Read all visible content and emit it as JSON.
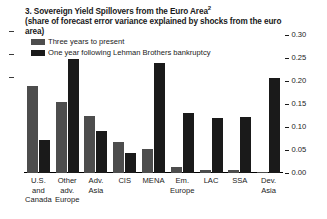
{
  "panel": {
    "number": "3.",
    "title_line1": "Sovereign Yield Spillovers from the Euro Area",
    "title_superscript": "2",
    "title_line2": "(share of forecast error variance explained by shocks from the euro area)"
  },
  "legend": {
    "position": "top-left",
    "items": [
      {
        "label": "Three years to present",
        "color": "#4d4d4d"
      },
      {
        "label": "One year following Lehman Brothers bankruptcy",
        "color": "#1a1a1a"
      }
    ]
  },
  "axis": {
    "side": "right",
    "ticks": [
      "0.00",
      "0.05",
      "0.10",
      "0.15",
      "0.20",
      "0.25",
      "0.30"
    ],
    "min": 0.0,
    "max": 0.3
  },
  "chart_data": {
    "type": "bar",
    "title": "3. Sovereign Yield Spillovers from the Euro Area",
    "subtitle": "(share of forecast error variance explained by shocks from the euro area)",
    "xlabel": "",
    "ylabel": "",
    "ylim": [
      0.0,
      0.3
    ],
    "yticks": [
      0.0,
      0.05,
      0.1,
      0.15,
      0.2,
      0.25,
      0.3
    ],
    "y_axis_position": "right",
    "grid": false,
    "legend_position": "top-left",
    "categories": [
      "U.S. and Canada",
      "Other adv. Europe",
      "Adv. Asia",
      "CIS",
      "MENA",
      "Em. Europe",
      "LAC",
      "SSA",
      "Dev. Asia"
    ],
    "category_lines": [
      [
        "U.S.",
        "and",
        "Canada"
      ],
      [
        "Other",
        "adv.",
        "Europe"
      ],
      [
        "Adv.",
        "Asia"
      ],
      [
        "CIS"
      ],
      [
        "MENA"
      ],
      [
        "Em.",
        "Europe"
      ],
      [
        "LAC"
      ],
      [
        "SSA"
      ],
      [
        "Dev.",
        "Asia"
      ]
    ],
    "series": [
      {
        "name": "Three years to present",
        "color": "#4d4d4d",
        "values": [
          0.189,
          0.155,
          0.125,
          0.067,
          0.052,
          0.012,
          0.006,
          0.006,
          0.003
        ]
      },
      {
        "name": "One year following Lehman Brothers bankruptcy",
        "color": "#1a1a1a",
        "values": [
          0.072,
          0.248,
          0.092,
          0.043,
          0.239,
          0.13,
          0.119,
          0.122,
          0.206
        ]
      }
    ]
  }
}
